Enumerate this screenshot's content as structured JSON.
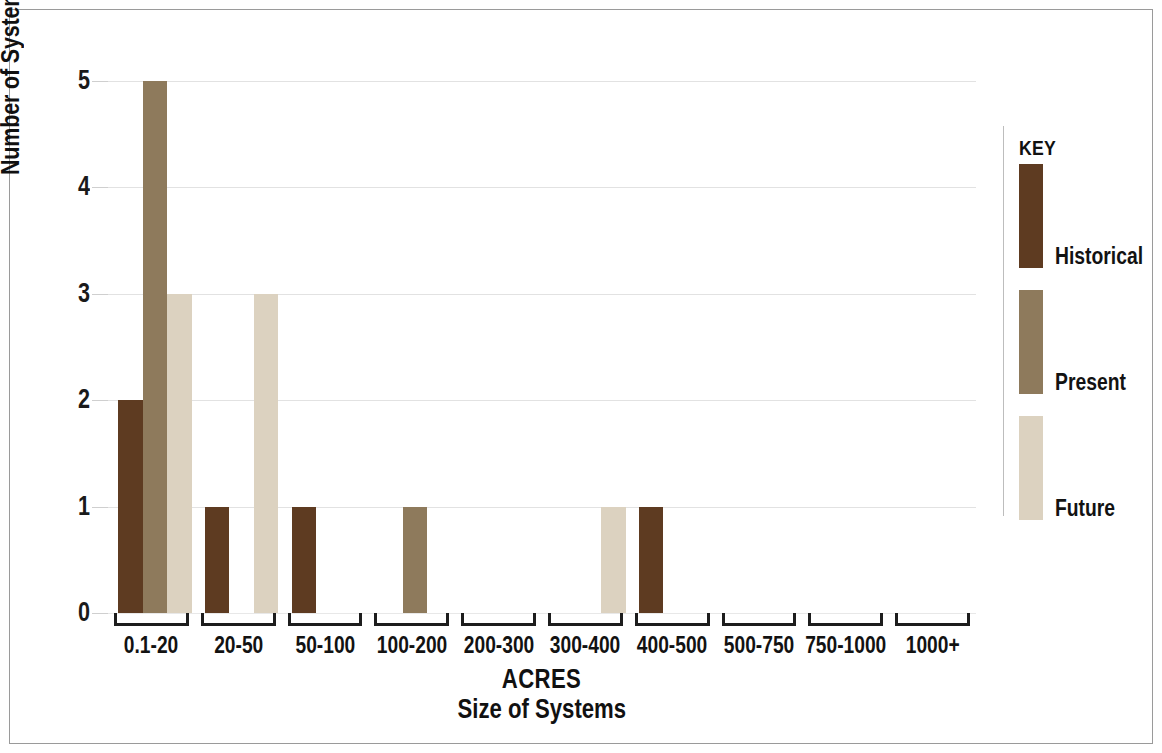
{
  "chart_data": {
    "type": "bar",
    "title": "",
    "xlabel": "ACRES",
    "xlabel_sub": "Size of Systems",
    "ylabel": "Number of Systems in Subregion",
    "categories": [
      "0.1-20",
      "20-50",
      "50-100",
      "100-200",
      "200-300",
      "300-400",
      "400-500",
      "500-750",
      "750-1000",
      "1000+"
    ],
    "series": [
      {
        "name": "Historical",
        "color": "#5E3B21",
        "values": [
          2,
          1,
          1,
          0,
          0,
          0,
          1,
          0,
          0,
          0
        ]
      },
      {
        "name": "Present",
        "color": "#8E7A5C",
        "values": [
          5,
          0,
          0,
          1,
          0,
          0,
          0,
          0,
          0,
          0
        ]
      },
      {
        "name": "Future",
        "color": "#DCD2C0",
        "values": [
          3,
          3,
          0,
          0,
          0,
          1,
          0,
          0,
          0,
          0
        ]
      }
    ],
    "ylim": [
      0,
      5
    ],
    "yticks": [
      0,
      1,
      2,
      3,
      4,
      5
    ],
    "ytick_labels": [
      "0",
      "1",
      "2",
      "3",
      "4",
      "5"
    ],
    "grid": true,
    "grid_axis": "y",
    "legend_position": "right",
    "legend_title": "KEY",
    "bar_group_style": "adjacent",
    "background_color": "#FFFFFF",
    "grid_color": "#E2E2E2",
    "axis_color": "#1D1D1D",
    "text_color": "#121212"
  },
  "legend": {
    "title": "KEY",
    "entries": [
      {
        "label": "Historical",
        "color": "#5E3B21"
      },
      {
        "label": "Present",
        "color": "#8E7A5C"
      },
      {
        "label": "Future",
        "color": "#DCD2C0"
      }
    ]
  },
  "axes": {
    "y_title": "Number of Systems in Subregion",
    "x_title_line1": "ACRES",
    "x_title_line2": "Size of Systems"
  }
}
